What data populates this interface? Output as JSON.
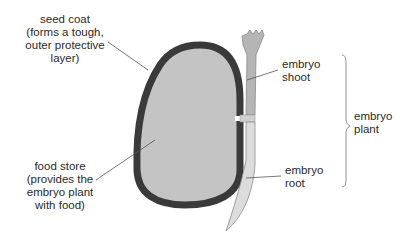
{
  "diagram": {
    "labels": {
      "seed_coat": [
        "seed coat",
        "(forms a tough,",
        "outer protective",
        "layer)"
      ],
      "food_store": [
        "food store",
        "(provides the",
        "embryo plant",
        "with food)"
      ],
      "embryo_shoot": [
        "embryo",
        "shoot"
      ],
      "embryo_root": [
        "embryo",
        "root"
      ],
      "embryo_plant": [
        "embryo",
        "plant"
      ]
    },
    "colors": {
      "seed_coat": "#3a3a3a",
      "food_store": "#c4c4c4",
      "embryo_shoot": "#b5b5b5",
      "embryo_root": "#dcdcdc",
      "leader_line": "#555555",
      "text": "#2a2a2a"
    }
  }
}
